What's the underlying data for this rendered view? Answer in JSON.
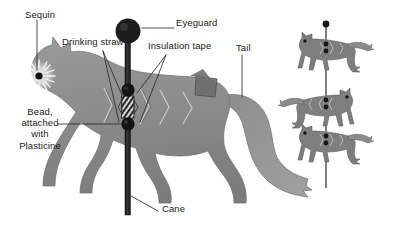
{
  "diagram": {
    "background_color": "#ffffff",
    "body_color": "#8c8c8c",
    "outline_color": "#6f6f6f",
    "hardware_color": "#1a1a1a",
    "text_color": "#1b1b1b",
    "leader_color": "#2a2a2a"
  },
  "labels": {
    "sequin": "Sequin",
    "eyeguard": "Eyeguard",
    "drinking_straw": "Drinking straw",
    "insulation_tape": "Insulation tape",
    "tail": "Tail",
    "bead": "Bead,\nattached\nwith\nPlasticine",
    "bead_line1": "Bead,",
    "bead_line2": "attached",
    "bead_line3": "with",
    "bead_line4": "Plasticine",
    "cane": "Cane"
  },
  "parts": [
    {
      "name": "sequin",
      "label": "Sequin",
      "location": "cat head / eye"
    },
    {
      "name": "eyeguard",
      "label": "Eyeguard",
      "location": "top of cane"
    },
    {
      "name": "drinking-straw",
      "label": "Drinking straw",
      "location": "cat body, on cane"
    },
    {
      "name": "insulation-tape",
      "label": "Insulation tape",
      "location": "cat body, on cane"
    },
    {
      "name": "tail",
      "label": "Tail",
      "location": "rear of cat"
    },
    {
      "name": "bead",
      "label": "Bead, attached with Plasticine",
      "location": "below straw on cane"
    },
    {
      "name": "cane",
      "label": "Cane",
      "location": "vertical pole"
    }
  ],
  "small_cats": {
    "count": 3,
    "facings": [
      "right",
      "left",
      "right"
    ],
    "note": "three small cats threaded on a thin vertical pole"
  }
}
